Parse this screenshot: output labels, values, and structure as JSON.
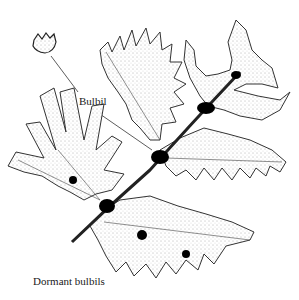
{
  "figure": {
    "labels": {
      "bulbil": "Bulbil",
      "dormant_bulbils": "Dormant bulbils"
    },
    "colors": {
      "ink": "#1a1a1a",
      "stipple": "#555555",
      "bulbil_fill": "#000000",
      "background": "#ffffff"
    }
  }
}
